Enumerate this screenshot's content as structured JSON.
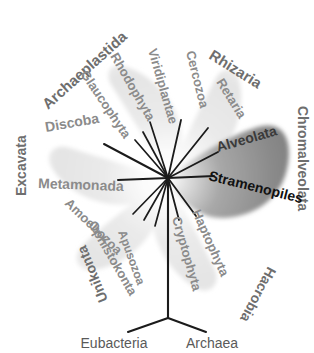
{
  "figure": {
    "center": {
      "x": 168,
      "y": 178
    },
    "colors": {
      "background": "#ffffff",
      "wedge_light": "#e9e9e9",
      "wedge_light_edge": "#f5f5f5",
      "wedge_dark": "#8f8f8f",
      "wedge_dark_edge": "#c9c9c9",
      "label_gray": "#8b8b8b",
      "label_dark": "#111111",
      "branch_line": "#1b1b1b",
      "root_label": "#5a5a5a"
    }
  },
  "supergroups": [
    {
      "id": "archaeplastida",
      "label": "Archaeplastida",
      "shade": "light",
      "label_x": 103,
      "label_y": 60,
      "rotate": -40,
      "members": [
        {
          "label": "Viridiplantae",
          "x": 154,
          "y": 68,
          "rotate": 72
        },
        {
          "label": "Rhodophyta",
          "x": 124,
          "y": 65,
          "rotate": 56
        },
        {
          "label": "Glaucophyta",
          "x": 96,
          "y": 78,
          "rotate": 50
        }
      ]
    },
    {
      "id": "rhizaria",
      "label": "Rhizaria",
      "shade": "light",
      "label_x": 226,
      "label_y": 48,
      "rotate": 30,
      "members": [
        {
          "label": "Cercozoa",
          "x": 188,
          "y": 62,
          "rotate": 74
        },
        {
          "label": "Retaria",
          "x": 224,
          "y": 92,
          "rotate": 57
        }
      ]
    },
    {
      "id": "chromalveolata",
      "label": "Chromalveolata",
      "shade": "dark",
      "label_x": 296,
      "label_y": 112,
      "rotate": 90,
      "members": [
        {
          "label": "Alveolata",
          "x": 230,
          "y": 146,
          "rotate": -16
        },
        {
          "label": "Stramenopiles",
          "x": 226,
          "y": 182,
          "rotate": 16
        }
      ]
    },
    {
      "id": "hacrobia",
      "label": "Hacrobia",
      "shade": "light",
      "label_x": 236,
      "label_y": 278,
      "rotate": 118,
      "members": [
        {
          "label": "Haptophyta",
          "x": 206,
          "y": 222,
          "rotate": 68
        },
        {
          "label": "Cryptophyta",
          "x": 186,
          "y": 228,
          "rotate": 75
        }
      ]
    },
    {
      "id": "unikonta",
      "label": "Unikonta",
      "shade": "light",
      "label_x": 76,
      "label_y": 274,
      "rotate": 250,
      "members": [
        {
          "label": "Amoebozoa",
          "x": 82,
          "y": 218,
          "rotate": 48
        },
        {
          "label": "Ophistokonta",
          "x": 104,
          "y": 239,
          "rotate": 62
        },
        {
          "label": "Apusozoa",
          "x": 134,
          "y": 244,
          "rotate": 72
        }
      ]
    },
    {
      "id": "excavata",
      "label": "Excavata",
      "shade": "light",
      "label_x": 22,
      "label_y": 156,
      "rotate": -90,
      "members": [
        {
          "label": "Discoba",
          "x": 52,
          "y": 126,
          "rotate": -12
        },
        {
          "label": "Metamonada",
          "x": 44,
          "y": 176,
          "rotate": 4
        }
      ]
    }
  ],
  "root": {
    "stem_label": "",
    "branches": [
      {
        "label": "Eubacteria",
        "x": 114,
        "y": 344
      },
      {
        "label": "Archaea",
        "x": 210,
        "y": 344
      }
    ]
  }
}
